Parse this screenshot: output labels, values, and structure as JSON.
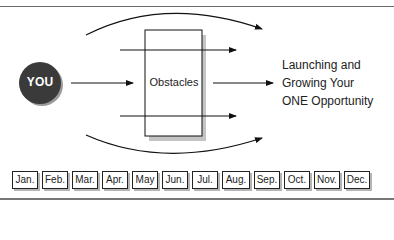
{
  "diagram": {
    "source_node": {
      "label": "YOU",
      "fill": "#3a3a3a",
      "text_color": "#ffffff"
    },
    "obstacle_box": {
      "label": "Obstacles"
    },
    "goal": {
      "lines": [
        "Launching and",
        "Growing Your",
        "ONE Opportunity"
      ]
    },
    "arrows": [
      {
        "from": "YOU",
        "to": "Obstacles",
        "style": "straight"
      },
      {
        "from": "Obstacles",
        "to": "goal",
        "style": "straight"
      },
      {
        "path": "upper arc bypassing obstacles",
        "style": "curved"
      },
      {
        "path": "lower arc bypassing obstacles",
        "style": "curved"
      },
      {
        "path": "upper line through obstacles",
        "style": "straight"
      },
      {
        "path": "lower line through obstacles",
        "style": "straight"
      }
    ],
    "timeline": {
      "months": [
        "Jan.",
        "Feb.",
        "Mar.",
        "Apr.",
        "May",
        "Jun.",
        "Jul.",
        "Aug.",
        "Sep.",
        "Oct.",
        "Nov.",
        "Dec."
      ]
    }
  }
}
